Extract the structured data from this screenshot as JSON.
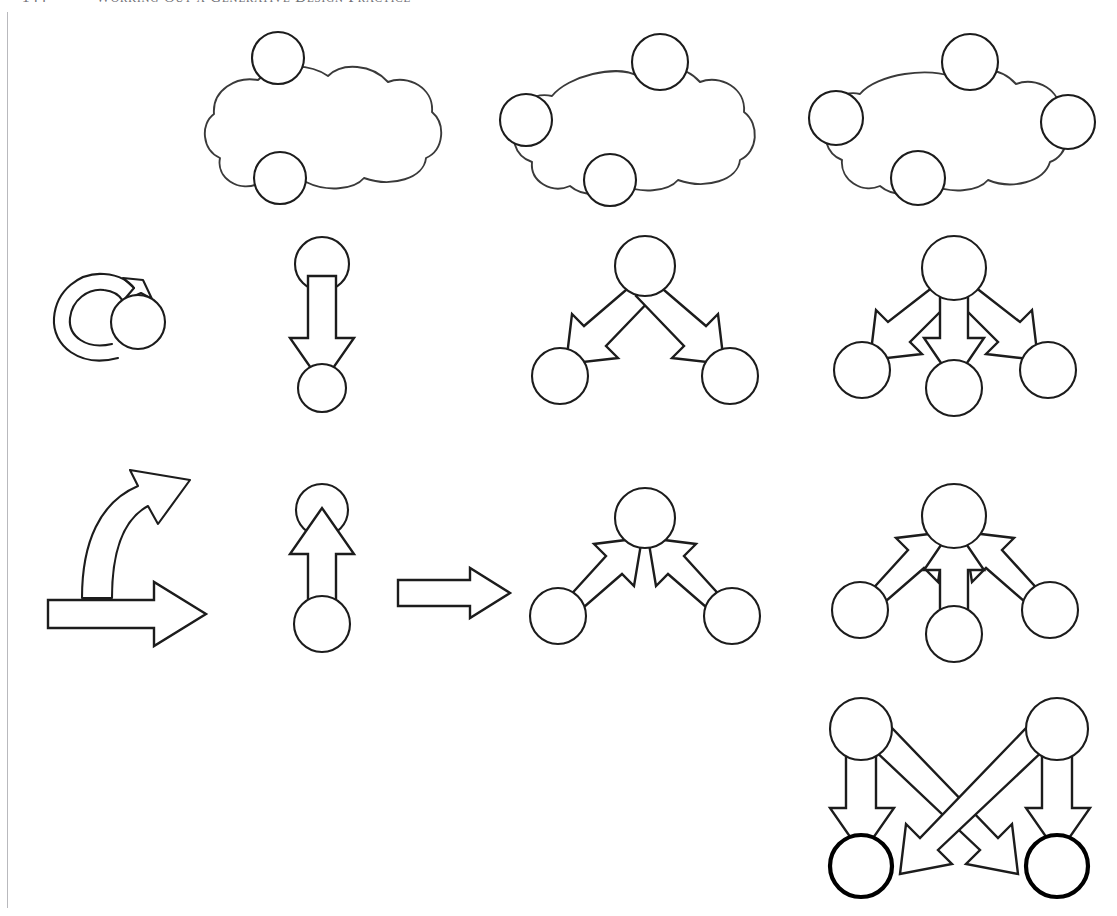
{
  "page": {
    "folio": "144",
    "running_head": "Working Out a Generative Design Practice",
    "background_color": "#ffffff",
    "ink_color": "#1c1c1c",
    "rule_color": "#b9b9bd"
  },
  "diagram": {
    "caption": "",
    "rows": [
      {
        "name": "cloud-row",
        "label": "clouds with boundary nodes"
      },
      {
        "name": "divergence-row",
        "label": "one-to-many fan out"
      },
      {
        "name": "convergence-row",
        "label": "many-to-one fan in"
      },
      {
        "name": "crossing-row",
        "label": "bipartite crossing"
      }
    ],
    "figures": [
      {
        "id": "cloud-2",
        "name": "cloud-two-nodes",
        "node_count": 2,
        "column": 2,
        "row": 1
      },
      {
        "id": "cloud-3",
        "name": "cloud-three-nodes",
        "node_count": 3,
        "column": 3,
        "row": 1
      },
      {
        "id": "cloud-4",
        "name": "cloud-four-nodes",
        "node_count": 4,
        "column": 4,
        "row": 1
      },
      {
        "id": "self-loop",
        "name": "self-loop-arrow",
        "node_count": 1,
        "arrow_count": 1,
        "column": 1,
        "row": 2
      },
      {
        "id": "down-1",
        "name": "one-to-one-down",
        "node_count": 2,
        "arrow_count": 1,
        "column": 2,
        "row": 2
      },
      {
        "id": "fan-out-2",
        "name": "one-to-two-divergence",
        "node_count": 3,
        "arrow_count": 2,
        "column": 3,
        "row": 2
      },
      {
        "id": "fan-out-3",
        "name": "one-to-three-divergence",
        "node_count": 4,
        "arrow_count": 3,
        "column": 4,
        "row": 2
      },
      {
        "id": "curved",
        "name": "branching-curved-arrow",
        "arrow_count": 2,
        "column": 1,
        "row": 3
      },
      {
        "id": "up-1",
        "name": "one-to-one-up",
        "node_count": 2,
        "arrow_count": 1,
        "column": 2,
        "row": 3
      },
      {
        "id": "plain-arrow",
        "name": "plain-right-arrow",
        "arrow_count": 1,
        "column": 2.5,
        "row": 3
      },
      {
        "id": "fan-in-2",
        "name": "two-to-one-convergence",
        "node_count": 3,
        "arrow_count": 2,
        "column": 3,
        "row": 3
      },
      {
        "id": "fan-in-3",
        "name": "three-to-one-convergence",
        "node_count": 4,
        "arrow_count": 3,
        "column": 4,
        "row": 3
      },
      {
        "id": "cross-2x2",
        "name": "two-by-two-crossing",
        "node_count": 4,
        "arrow_count": 4,
        "column": 4,
        "row": 4
      }
    ]
  }
}
